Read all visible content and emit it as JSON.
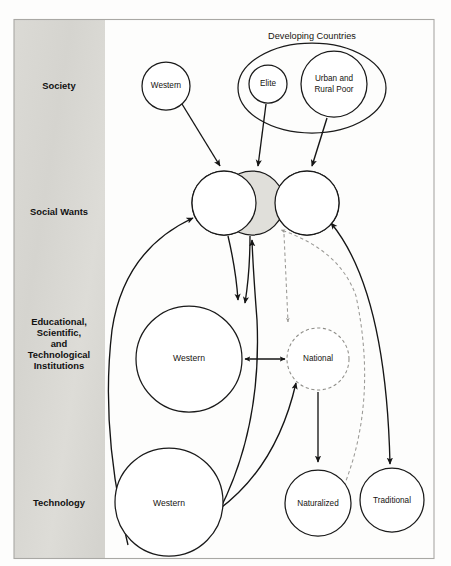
{
  "figure": {
    "domain": "diagram",
    "type": "conceptual-flow-diagram",
    "background_color": "#fdfdfc",
    "frame_color": "#a9a8a4",
    "band_color": "#d9d8d3",
    "line_color": "#151515",
    "dashed_color": "#9a9995",
    "shaded_fill": "#e0dfda"
  },
  "bands": [
    {
      "id": "society",
      "label": "Society",
      "x": 59,
      "y": 86
    },
    {
      "id": "social-wants",
      "label": "Social Wants",
      "x": 59,
      "y": 212
    },
    {
      "id": "institutions",
      "label": "Educational,\nScientific,\nand\nTechnological\nInstitutions",
      "x": 59,
      "y": 344,
      "lines": [
        "Educational,",
        "Scientific,",
        "and",
        "Technological",
        "Institutions"
      ]
    },
    {
      "id": "technology",
      "label": "Technology",
      "x": 59,
      "y": 503
    }
  ],
  "groups": [
    {
      "id": "developing-countries",
      "label": "Developing Countries",
      "label_x": 312,
      "label_y": 36,
      "cx": 312,
      "cy": 87,
      "rx": 74,
      "ry": 44
    }
  ],
  "nodes": [
    {
      "id": "society-western",
      "label": "Western",
      "cx": 166,
      "cy": 86,
      "r": 24,
      "style": "solid",
      "lines": [
        "Western"
      ]
    },
    {
      "id": "society-elite",
      "label": "Elite",
      "cx": 268,
      "cy": 84,
      "r": 19,
      "style": "solid",
      "lines": [
        "Elite"
      ]
    },
    {
      "id": "society-urban-poor",
      "label": "Urban and Rural Poor",
      "cx": 334,
      "cy": 84,
      "r": 33,
      "style": "solid",
      "lines": [
        "Urban and",
        "Rural Poor"
      ]
    },
    {
      "id": "wants-left",
      "label": "",
      "cx": 224,
      "cy": 203,
      "r": 32,
      "style": "solid",
      "lines": []
    },
    {
      "id": "wants-middle",
      "label": "",
      "cx": 252,
      "cy": 203,
      "r": 32,
      "style": "shaded",
      "lines": []
    },
    {
      "id": "wants-right",
      "label": "",
      "cx": 307,
      "cy": 203,
      "r": 32,
      "style": "solid",
      "lines": []
    },
    {
      "id": "institution-western",
      "label": "Western",
      "cx": 189,
      "cy": 359,
      "r": 53,
      "style": "solid",
      "lines": [
        "Western"
      ]
    },
    {
      "id": "institution-national",
      "label": "National",
      "cx": 318,
      "cy": 359,
      "r": 31,
      "style": "dashed",
      "lines": [
        "National"
      ]
    },
    {
      "id": "technology-western",
      "label": "Western",
      "cx": 169,
      "cy": 502,
      "r": 54,
      "style": "solid",
      "lines": [
        "Western"
      ]
    },
    {
      "id": "technology-naturalized",
      "label": "Naturalized",
      "cx": 318,
      "cy": 503,
      "r": 33,
      "style": "solid",
      "lines": [
        "Naturalized"
      ]
    },
    {
      "id": "technology-traditional",
      "label": "Traditional",
      "cx": 392,
      "cy": 500,
      "r": 32,
      "style": "solid",
      "lines": [
        "Traditional"
      ]
    }
  ],
  "edges": [
    {
      "id": "edge-society-western-to-wants",
      "from": "society-western",
      "to": "wants-left",
      "style": "solid",
      "arrows": "end"
    },
    {
      "id": "edge-elite-to-wants",
      "from": "society-elite",
      "to": "wants-middle",
      "style": "solid",
      "arrows": "end"
    },
    {
      "id": "edge-urban-poor-to-wants",
      "from": "society-urban-poor",
      "to": "wants-right",
      "style": "solid",
      "arrows": "end"
    },
    {
      "id": "edge-wants-to-institution-western-a",
      "from": "wants-left",
      "to": "institution-western",
      "style": "solid",
      "arrows": "end"
    },
    {
      "id": "edge-wants-to-institution-western-b",
      "from": "wants-middle",
      "to": "institution-western",
      "style": "solid",
      "arrows": "end"
    },
    {
      "id": "edge-wants-to-national",
      "from": "wants-middle",
      "to": "institution-national",
      "style": "dashed",
      "arrows": "end"
    },
    {
      "id": "edge-institution-western-to-national",
      "from": "institution-western",
      "to": "institution-national",
      "style": "solid",
      "arrows": "both"
    },
    {
      "id": "edge-technology-western-to-wants",
      "from": "technology-western",
      "to": "wants-left",
      "style": "solid",
      "arrows": "end"
    },
    {
      "id": "edge-technology-western-to-wants-2",
      "from": "technology-western",
      "to": "wants-middle",
      "style": "solid",
      "arrows": "end"
    },
    {
      "id": "edge-technology-western-to-national",
      "from": "technology-western",
      "to": "institution-national",
      "style": "solid",
      "arrows": "end"
    },
    {
      "id": "edge-national-to-naturalized",
      "from": "institution-national",
      "to": "technology-naturalized",
      "style": "solid",
      "arrows": "end"
    },
    {
      "id": "edge-naturalized-to-wants",
      "from": "technology-naturalized",
      "to": "wants-middle",
      "style": "dashed",
      "arrows": "end"
    },
    {
      "id": "edge-wants-to-traditional",
      "from": "wants-right",
      "to": "technology-traditional",
      "style": "solid",
      "arrows": "both"
    }
  ]
}
